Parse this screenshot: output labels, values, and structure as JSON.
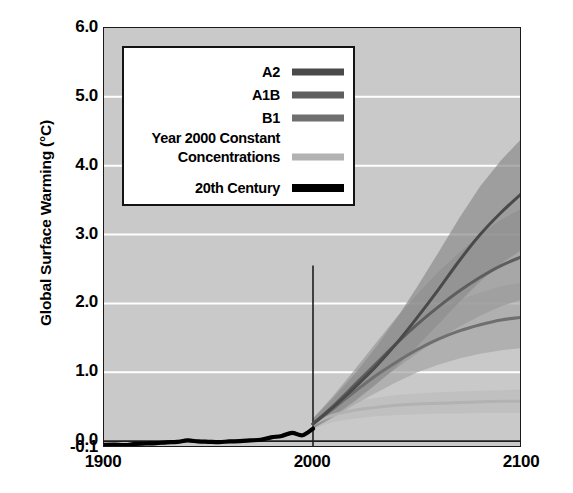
{
  "chart_data": {
    "type": "line",
    "title": "",
    "xlabel": "",
    "ylabel": "Global Surface Warming (°C)",
    "xlim": [
      1900,
      2100
    ],
    "ylim": [
      -0.1,
      6.0
    ],
    "xticks": [
      "1900",
      "2000",
      "2100"
    ],
    "xtick_values": [
      1900,
      2000,
      2100
    ],
    "yticks": [
      "6.0",
      "5.0",
      "4.0",
      "3.0",
      "2.0",
      "1.0",
      "0.0",
      "-0.1"
    ],
    "ytick_values": [
      6.0,
      5.0,
      4.0,
      3.0,
      2.0,
      1.0,
      0.0,
      -0.1
    ],
    "grid": true,
    "grid_color": "#ffffff",
    "plot_background": "#c9c9c9",
    "legend_position": "top-left",
    "reference_line_year": 2000,
    "zero_line_value": 0.0,
    "series": [
      {
        "name": "A2",
        "color": "#4a4a4a",
        "band_color": "#8e8e8e",
        "x": [
          2000,
          2010,
          2020,
          2030,
          2040,
          2050,
          2060,
          2070,
          2080,
          2090,
          2100
        ],
        "values": [
          0.25,
          0.5,
          0.78,
          1.08,
          1.42,
          1.8,
          2.2,
          2.62,
          3.0,
          3.32,
          3.6
        ],
        "band_low": [
          0.18,
          0.36,
          0.58,
          0.82,
          1.08,
          1.38,
          1.7,
          2.02,
          2.32,
          2.58,
          2.78
        ],
        "band_high": [
          0.33,
          0.64,
          0.98,
          1.36,
          1.78,
          2.25,
          2.74,
          3.24,
          3.7,
          4.08,
          4.4
        ]
      },
      {
        "name": "A1B",
        "color": "#5e5e5e",
        "band_color": "#9a9a9a",
        "x": [
          2000,
          2010,
          2020,
          2030,
          2040,
          2050,
          2060,
          2070,
          2080,
          2090,
          2100
        ],
        "values": [
          0.25,
          0.52,
          0.82,
          1.12,
          1.42,
          1.7,
          1.95,
          2.18,
          2.38,
          2.55,
          2.68
        ],
        "band_low": [
          0.18,
          0.38,
          0.6,
          0.84,
          1.06,
          1.28,
          1.48,
          1.66,
          1.82,
          1.96,
          2.06
        ],
        "band_high": [
          0.33,
          0.67,
          1.04,
          1.42,
          1.8,
          2.14,
          2.46,
          2.74,
          3.0,
          3.22,
          3.38
        ]
      },
      {
        "name": "B1",
        "color": "#6f6f6f",
        "band_color": "#a6a6a6",
        "x": [
          2000,
          2010,
          2020,
          2030,
          2040,
          2050,
          2060,
          2070,
          2080,
          2090,
          2100
        ],
        "values": [
          0.25,
          0.48,
          0.72,
          0.95,
          1.15,
          1.33,
          1.48,
          1.6,
          1.69,
          1.76,
          1.8
        ],
        "band_low": [
          0.18,
          0.35,
          0.53,
          0.7,
          0.86,
          1.0,
          1.11,
          1.2,
          1.27,
          1.32,
          1.35
        ],
        "band_high": [
          0.33,
          0.62,
          0.92,
          1.21,
          1.47,
          1.7,
          1.89,
          2.05,
          2.16,
          2.25,
          2.3
        ]
      },
      {
        "name": "Year 2000 Constant Concentrations",
        "color": "#b2b2b2",
        "band_color": "#bcbcbc",
        "x": [
          2000,
          2010,
          2020,
          2030,
          2040,
          2050,
          2060,
          2070,
          2080,
          2090,
          2100
        ],
        "values": [
          0.25,
          0.38,
          0.45,
          0.49,
          0.52,
          0.54,
          0.55,
          0.56,
          0.57,
          0.58,
          0.58
        ],
        "band_low": [
          0.18,
          0.28,
          0.33,
          0.36,
          0.38,
          0.39,
          0.4,
          0.4,
          0.41,
          0.41,
          0.41
        ],
        "band_high": [
          0.33,
          0.49,
          0.58,
          0.63,
          0.67,
          0.69,
          0.71,
          0.72,
          0.73,
          0.74,
          0.75
        ]
      },
      {
        "name": "20th Century",
        "color": "#000000",
        "band_color": "#9d9d9d",
        "x": [
          1900,
          1905,
          1910,
          1915,
          1920,
          1925,
          1930,
          1935,
          1940,
          1945,
          1950,
          1955,
          1960,
          1965,
          1970,
          1975,
          1980,
          1985,
          1990,
          1995,
          2000
        ],
        "values": [
          -0.055,
          -0.05,
          -0.058,
          -0.04,
          -0.035,
          -0.03,
          -0.018,
          -0.012,
          0.01,
          -0.005,
          -0.01,
          -0.015,
          -0.005,
          0.0,
          0.01,
          0.02,
          0.055,
          0.075,
          0.12,
          0.085,
          0.18
        ],
        "band_low": [
          -0.075,
          -0.072,
          -0.08,
          -0.065,
          -0.06,
          -0.058,
          -0.045,
          -0.04,
          -0.015,
          -0.03,
          -0.035,
          -0.04,
          -0.03,
          -0.025,
          -0.012,
          -0.002,
          0.03,
          0.05,
          0.095,
          0.06,
          0.15
        ],
        "band_high": [
          -0.035,
          -0.028,
          -0.036,
          -0.015,
          -0.01,
          -0.002,
          0.01,
          0.016,
          0.038,
          0.022,
          0.016,
          0.01,
          0.02,
          0.025,
          0.035,
          0.045,
          0.082,
          0.102,
          0.148,
          0.112,
          0.21
        ]
      }
    ]
  },
  "axis": {
    "y_title": "Global Surface Warming (°C)",
    "y_labels": [
      "6.0",
      "5.0",
      "4.0",
      "3.0",
      "2.0",
      "1.0",
      "0.0",
      "-0.1"
    ],
    "x_labels": [
      "1900",
      "2000",
      "2100"
    ]
  },
  "legend": {
    "entries": [
      {
        "label": "A2",
        "swatch": "#4a4a4a",
        "thick": false
      },
      {
        "label": "A1B",
        "swatch": "#5e5e5e",
        "thick": false
      },
      {
        "label": "B1",
        "swatch": "#6f6f6f",
        "thick": false
      },
      {
        "label": "Year 2000 Constant Concentrations",
        "swatch": "#b2b2b2",
        "thick": false
      },
      {
        "label": "20th Century",
        "swatch": "#000000",
        "thick": true
      }
    ]
  }
}
